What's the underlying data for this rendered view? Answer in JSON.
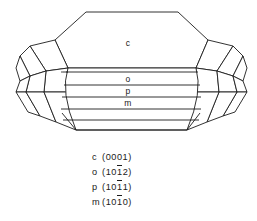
{
  "figure": {
    "background_color": "#ffffff",
    "line_color": "#1c1c1c",
    "text_color": "#1a1a1a"
  },
  "crystal": {
    "face_labels": [
      {
        "symbol": "c",
        "x": 128,
        "y": 46
      },
      {
        "symbol": "o",
        "x": 128,
        "y": 79
      },
      {
        "symbol": "p",
        "x": 128,
        "y": 91
      },
      {
        "symbol": "m",
        "x": 128,
        "y": 103
      }
    ]
  },
  "legend": {
    "entries": [
      {
        "symbol": "c",
        "open": "(",
        "pre": "000",
        "bar": "",
        "post": "1",
        "close": ")",
        "full": "c (0001)",
        "top": 2
      },
      {
        "symbol": "o",
        "open": "(",
        "pre": "10",
        "bar": "1",
        "post": "2",
        "close": ")",
        "full": "o (101̅2)",
        "top": 17
      },
      {
        "symbol": "p",
        "open": "(",
        "pre": "10",
        "bar": "1",
        "post": "1",
        "close": ")",
        "full": "p (101̅1)",
        "top": 32
      },
      {
        "symbol": "m",
        "open": "(",
        "pre": "10",
        "bar": "1",
        "post": "0",
        "close": ")",
        "full": "m (101̅0)",
        "top": 47
      }
    ]
  }
}
